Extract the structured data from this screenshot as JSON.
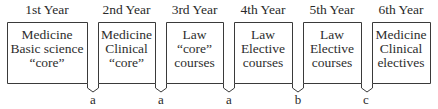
{
  "diagram": {
    "years": [
      {
        "label": "1st Year",
        "lines": [
          "Medicine",
          "Basic science",
          "“core”"
        ],
        "box": {
          "x1": 7,
          "x2": 87
        }
      },
      {
        "label": "2nd Year",
        "lines": [
          "Medicine",
          "Clinical",
          "“core”"
        ],
        "box": {
          "x1": 98,
          "x2": 155
        }
      },
      {
        "label": "3rd Year",
        "lines": [
          "Law",
          "“core”",
          "courses"
        ],
        "box": {
          "x1": 166,
          "x2": 223
        }
      },
      {
        "label": "4th Year",
        "lines": [
          "Law",
          "Elective",
          "courses"
        ],
        "box": {
          "x1": 234,
          "x2": 292
        }
      },
      {
        "label": "5th Year",
        "lines": [
          "Law",
          "Elective",
          "courses"
        ],
        "box": {
          "x1": 303,
          "x2": 361
        }
      },
      {
        "label": "6th Year",
        "lines": [
          "Medicine",
          "Clinical",
          "electives"
        ],
        "box": {
          "x1": 372,
          "x2": 430
        }
      }
    ],
    "transitions": [
      {
        "label": "a",
        "x": 93
      },
      {
        "label": "a",
        "x": 161
      },
      {
        "label": "a",
        "x": 229
      },
      {
        "label": "b",
        "x": 298
      },
      {
        "label": "c",
        "x": 366
      }
    ],
    "colors": {
      "line": "#3a3a3a",
      "text": "#2a2a2a",
      "background": "#ffffff"
    }
  }
}
